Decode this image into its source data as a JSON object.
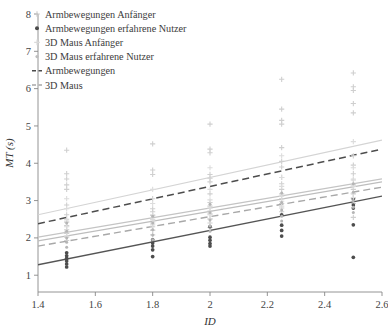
{
  "chart_data": {
    "type": "scatter",
    "title": "",
    "xlabel": "ID",
    "ylabel": "MT (s)",
    "xlim": [
      1.4,
      2.6
    ],
    "ylim": [
      0.55,
      8.0
    ],
    "xticks": [
      "1.4",
      "1.6",
      "1.8",
      "2",
      "2.2",
      "2.4",
      "2.6"
    ],
    "xtick_values": [
      1.4,
      1.6,
      1.8,
      2.0,
      2.2,
      2.4,
      2.6
    ],
    "yticks": [
      "1",
      "2",
      "3",
      "4",
      "5",
      "6",
      "7",
      "8"
    ],
    "ytick_values": [
      1,
      2,
      3,
      4,
      5,
      6,
      7,
      8
    ],
    "grid": false,
    "legend_position": "top-left",
    "legend": [
      {
        "label": "Armbewegungen Anfänger",
        "marker": "plus",
        "color": "#c9c9c9",
        "style": "marker"
      },
      {
        "label": "Armbewegungen erfahrene Nutzer",
        "marker": "dot",
        "color": "#4a4a4a",
        "style": "marker"
      },
      {
        "label": "3D Maus Anfänger",
        "marker": "plus",
        "color": "#d9d9d9",
        "style": "marker"
      },
      {
        "label": "3D Maus erfahrene Nutzer",
        "marker": "dot-small",
        "color": "#bdbdbd",
        "style": "marker"
      },
      {
        "label": "Armbewegungen",
        "marker": "dashed",
        "color": "#4a4a4a",
        "style": "line"
      },
      {
        "label": "3D Maus",
        "marker": "dashed",
        "color": "#a8a8a8",
        "style": "line"
      }
    ],
    "series": [
      {
        "name": "Armbewegungen Anfänger",
        "marker": "plus",
        "color": "#cfcfcf",
        "points": [
          [
            1.5,
            4.35
          ],
          [
            1.5,
            3.72
          ],
          [
            1.5,
            3.58
          ],
          [
            1.5,
            3.42
          ],
          [
            1.5,
            3.3
          ],
          [
            1.5,
            2.88
          ],
          [
            1.5,
            2.62
          ],
          [
            1.5,
            2.5
          ],
          [
            1.5,
            2.42
          ],
          [
            1.5,
            2.33
          ],
          [
            1.5,
            2.22
          ],
          [
            1.5,
            2.12
          ],
          [
            1.5,
            2.02
          ],
          [
            1.5,
            1.93
          ],
          [
            1.8,
            4.52
          ],
          [
            1.8,
            3.82
          ],
          [
            1.8,
            3.7
          ],
          [
            1.8,
            3.05
          ],
          [
            1.8,
            2.78
          ],
          [
            1.8,
            2.7
          ],
          [
            1.8,
            2.6
          ],
          [
            1.8,
            2.5
          ],
          [
            1.8,
            2.4
          ],
          [
            1.8,
            2.3
          ],
          [
            1.8,
            2.2
          ],
          [
            1.8,
            2.08
          ],
          [
            2.0,
            5.05
          ],
          [
            2.0,
            4.38
          ],
          [
            2.0,
            4.28
          ],
          [
            2.0,
            3.7
          ],
          [
            2.0,
            3.6
          ],
          [
            2.0,
            3.5
          ],
          [
            2.0,
            3.18
          ],
          [
            2.0,
            2.95
          ],
          [
            2.0,
            2.85
          ],
          [
            2.0,
            2.72
          ],
          [
            2.0,
            2.62
          ],
          [
            2.0,
            2.5
          ],
          [
            2.0,
            2.4
          ],
          [
            2.0,
            2.28
          ],
          [
            2.25,
            6.25
          ],
          [
            2.25,
            5.45
          ],
          [
            2.25,
            5.15
          ],
          [
            2.25,
            5.05
          ],
          [
            2.25,
            4.42
          ],
          [
            2.25,
            4.05
          ],
          [
            2.25,
            3.9
          ],
          [
            2.25,
            3.62
          ],
          [
            2.25,
            3.45
          ],
          [
            2.25,
            3.3
          ],
          [
            2.25,
            3.18
          ],
          [
            2.25,
            3.05
          ],
          [
            2.25,
            2.92
          ],
          [
            2.25,
            2.8
          ],
          [
            2.25,
            2.7
          ],
          [
            2.5,
            6.42
          ],
          [
            2.5,
            6.05
          ],
          [
            2.5,
            5.95
          ],
          [
            2.5,
            5.6
          ],
          [
            2.5,
            5.35
          ],
          [
            2.5,
            4.2
          ],
          [
            2.5,
            3.95
          ],
          [
            2.5,
            3.72
          ],
          [
            2.5,
            3.55
          ],
          [
            2.5,
            3.42
          ],
          [
            2.5,
            3.3
          ],
          [
            2.5,
            3.18
          ],
          [
            2.5,
            3.05
          ],
          [
            2.5,
            2.92
          ],
          [
            2.5,
            2.55
          ]
        ]
      },
      {
        "name": "Armbewegungen erfahrene Nutzer",
        "marker": "dot",
        "color": "#4d4d4d",
        "points": [
          [
            1.5,
            1.6
          ],
          [
            1.5,
            1.52
          ],
          [
            1.5,
            1.45
          ],
          [
            1.5,
            1.38
          ],
          [
            1.5,
            1.3
          ],
          [
            1.5,
            1.22
          ],
          [
            1.8,
            1.95
          ],
          [
            1.8,
            1.86
          ],
          [
            1.8,
            1.78
          ],
          [
            1.8,
            1.68
          ],
          [
            1.8,
            1.5
          ],
          [
            2.0,
            2.3
          ],
          [
            2.0,
            2.02
          ],
          [
            2.0,
            1.94
          ],
          [
            2.0,
            1.85
          ],
          [
            2.0,
            1.78
          ],
          [
            2.25,
            2.62
          ],
          [
            2.25,
            2.34
          ],
          [
            2.25,
            2.2
          ],
          [
            2.25,
            2.05
          ],
          [
            2.5,
            3.05
          ],
          [
            2.5,
            2.88
          ],
          [
            2.5,
            2.8
          ],
          [
            2.5,
            2.35
          ],
          [
            2.5,
            1.48
          ]
        ]
      },
      {
        "name": "3D Maus Anfänger",
        "marker": "plus",
        "color": "#dcdcdc",
        "points": [
          [
            1.5,
            3.05
          ],
          [
            1.5,
            2.78
          ],
          [
            1.5,
            2.45
          ],
          [
            1.5,
            2.3
          ],
          [
            1.5,
            2.18
          ],
          [
            1.5,
            2.05
          ],
          [
            1.8,
            3.3
          ],
          [
            1.8,
            2.92
          ],
          [
            1.8,
            2.62
          ],
          [
            1.8,
            2.48
          ],
          [
            1.8,
            2.35
          ],
          [
            1.8,
            2.22
          ],
          [
            2.0,
            3.88
          ],
          [
            2.0,
            3.3
          ],
          [
            2.0,
            3.02
          ],
          [
            2.0,
            2.8
          ],
          [
            2.0,
            2.65
          ],
          [
            2.0,
            2.52
          ],
          [
            2.25,
            4.2
          ],
          [
            2.25,
            3.62
          ],
          [
            2.25,
            3.38
          ],
          [
            2.25,
            3.12
          ],
          [
            2.25,
            2.98
          ],
          [
            2.25,
            2.85
          ],
          [
            2.5,
            4.58
          ],
          [
            2.5,
            3.88
          ],
          [
            2.5,
            3.58
          ],
          [
            2.5,
            3.38
          ],
          [
            2.5,
            3.2
          ],
          [
            2.5,
            3.08
          ]
        ]
      },
      {
        "name": "3D Maus erfahrene Nutzer",
        "marker": "dot-small",
        "color": "#b5b5b5",
        "points": [
          [
            1.5,
            2.4
          ],
          [
            1.5,
            2.18
          ],
          [
            1.5,
            2.0
          ],
          [
            1.5,
            1.88
          ],
          [
            1.5,
            1.75
          ],
          [
            1.8,
            2.58
          ],
          [
            1.8,
            2.4
          ],
          [
            1.8,
            2.22
          ],
          [
            1.8,
            2.08
          ],
          [
            1.8,
            1.95
          ],
          [
            2.0,
            2.9
          ],
          [
            2.0,
            2.68
          ],
          [
            2.0,
            2.48
          ],
          [
            2.0,
            2.32
          ],
          [
            2.0,
            2.18
          ],
          [
            2.25,
            3.2
          ],
          [
            2.25,
            2.95
          ],
          [
            2.25,
            2.75
          ],
          [
            2.25,
            2.58
          ],
          [
            2.25,
            2.45
          ],
          [
            2.5,
            3.45
          ],
          [
            2.5,
            3.22
          ],
          [
            2.5,
            3.0
          ],
          [
            2.5,
            2.82
          ],
          [
            2.5,
            2.68
          ]
        ]
      }
    ],
    "fit_lines": [
      {
        "name": "Armbewegungen Anfänger fit",
        "style": "solid",
        "color": "#d4d4d4",
        "width": 1.2,
        "x0": 1.4,
        "y0": 2.62,
        "x1": 2.6,
        "y1": 4.62
      },
      {
        "name": "Armbewegungen",
        "style": "dashed",
        "color": "#4d4d4d",
        "width": 1.5,
        "x0": 1.4,
        "y0": 2.38,
        "x1": 2.6,
        "y1": 4.38
      },
      {
        "name": "3D Maus Anfänger fit",
        "style": "solid",
        "color": "#c4c4c4",
        "width": 1.2,
        "x0": 1.4,
        "y0": 2.02,
        "x1": 2.6,
        "y1": 3.58
      },
      {
        "name": "3D Maus erfahrene Nutzer fit",
        "style": "solid",
        "color": "#bdbdbd",
        "width": 1.2,
        "x0": 1.4,
        "y0": 1.92,
        "x1": 2.6,
        "y1": 3.5
      },
      {
        "name": "3D Maus",
        "style": "dashed",
        "color": "#a8a8a8",
        "width": 1.4,
        "x0": 1.4,
        "y0": 1.78,
        "x1": 2.6,
        "y1": 3.36
      },
      {
        "name": "Armbewegungen erfahrene Nutzer fit",
        "style": "solid",
        "color": "#555555",
        "width": 1.4,
        "x0": 1.4,
        "y0": 1.28,
        "x1": 2.6,
        "y1": 3.12
      }
    ]
  }
}
